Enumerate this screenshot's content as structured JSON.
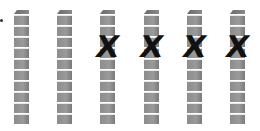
{
  "figure": {
    "rods": [
      {
        "index": 1,
        "cubes": 10,
        "crossed_out": false
      },
      {
        "index": 2,
        "cubes": 10,
        "crossed_out": false
      },
      {
        "index": 3,
        "cubes": 10,
        "crossed_out": true
      },
      {
        "index": 4,
        "cubes": 10,
        "crossed_out": true
      },
      {
        "index": 5,
        "cubes": 10,
        "crossed_out": true
      },
      {
        "index": 6,
        "cubes": 10,
        "crossed_out": true
      }
    ],
    "cross_mark": "X",
    "rod_color": "#8c8c8c",
    "mark_color": "#111111"
  }
}
